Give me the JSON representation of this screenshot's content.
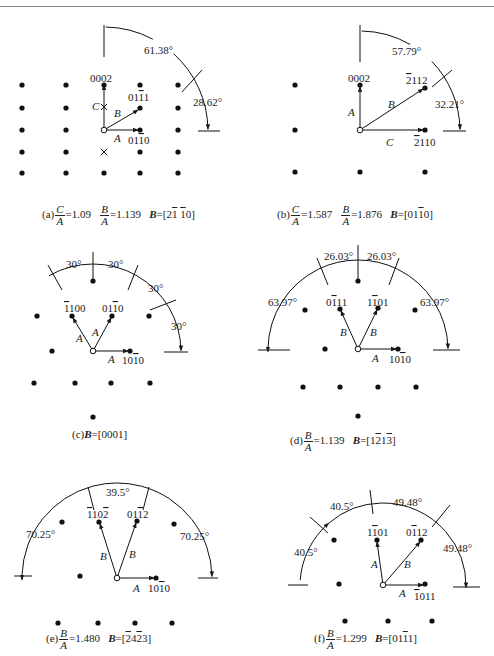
{
  "figure": {
    "panels": [
      {
        "id": "a",
        "caption": {
          "prefix": "(a)",
          "ratios": [
            {
              "num": "C",
              "den": "A",
              "value": "=1.09"
            },
            {
              "num": "B",
              "den": "A",
              "value": "=1.139"
            }
          ],
          "axis_label": "B",
          "axis_value": "=[2̅1̅ 1̅0]",
          "axis_parts": [
            [
              "2",
              false
            ],
            [
              "1",
              true
            ],
            [
              " ",
              false
            ],
            [
              "1",
              true
            ],
            [
              "0",
              false
            ]
          ]
        },
        "origin": [
          104,
          130
        ],
        "dots": [
          [
            22,
            85
          ],
          [
            66,
            85
          ],
          [
            104,
            85
          ],
          [
            140,
            85
          ],
          [
            178,
            85
          ],
          [
            22,
            108
          ],
          [
            66,
            108
          ],
          [
            140,
            108
          ],
          [
            178,
            108
          ],
          [
            22,
            130
          ],
          [
            66,
            130
          ],
          [
            140,
            130
          ],
          [
            178,
            130
          ],
          [
            22,
            152
          ],
          [
            66,
            152
          ],
          [
            140,
            152
          ],
          [
            178,
            152
          ],
          [
            22,
            173
          ],
          [
            66,
            173
          ],
          [
            104,
            173
          ],
          [
            140,
            173
          ],
          [
            178,
            173
          ]
        ],
        "crosses": [
          [
            104,
            107
          ],
          [
            104,
            152
          ]
        ],
        "vectors": [
          {
            "to": [
              104,
              85
            ],
            "label": "C",
            "lx": 92,
            "ly": 110
          },
          {
            "to": [
              138,
              110
            ],
            "label": "B",
            "lx": 114,
            "ly": 117
          },
          {
            "to": [
              138,
              130
            ],
            "label": "A",
            "lx": 114,
            "ly": 142
          }
        ],
        "spot_labels": [
          {
            "text": [
              [
                "0002",
                false
              ]
            ],
            "x": 90,
            "y": 82
          },
          {
            "text": [
              [
                "01",
                false
              ],
              [
                "1",
                true
              ],
              [
                "1",
                false
              ]
            ],
            "x": 128,
            "y": 101
          },
          {
            "text": [
              [
                "01",
                false
              ],
              [
                "1",
                true
              ],
              [
                "0",
                false
              ]
            ],
            "x": 128,
            "y": 144
          }
        ],
        "angles": [
          "61.38°",
          "28.62°"
        ]
      },
      {
        "id": "b",
        "caption": {
          "prefix": "(b)",
          "ratios": [
            {
              "num": "C",
              "den": "A",
              "value": "=1.587"
            },
            {
              "num": "B",
              "den": "A",
              "value": "=1.876"
            }
          ],
          "axis_label": "B",
          "axis_parts": [
            [
              "01",
              false
            ],
            [
              "1",
              true
            ],
            [
              "0",
              false
            ]
          ]
        },
        "spot_labels": [
          {
            "text": [
              [
                "0002",
                false
              ]
            ],
            "x": 0,
            "y": 0
          },
          {
            "text": [
              [
                "2",
                true
              ],
              [
                "112",
                false
              ]
            ],
            "x": 0,
            "y": 0
          },
          {
            "text": [
              [
                "2",
                true
              ],
              [
                "110",
                false
              ]
            ],
            "x": 0,
            "y": 0
          }
        ],
        "vectors": [
          {
            "label": "A"
          },
          {
            "label": "B"
          },
          {
            "label": "C"
          }
        ],
        "angles": [
          "57.79°",
          "32.21°"
        ]
      },
      {
        "id": "c",
        "caption": {
          "prefix": "(c)",
          "axis_label": "B",
          "axis_parts": [
            [
              "0001",
              false
            ]
          ]
        },
        "spot_labels": [
          {
            "text": [
              [
                "1",
                true
              ],
              [
                "100",
                false
              ]
            ]
          },
          {
            "text": [
              [
                "01",
                false
              ],
              [
                "1",
                true
              ],
              [
                "0",
                false
              ]
            ]
          },
          {
            "text": [
              [
                "10",
                false
              ],
              [
                "1",
                true
              ],
              [
                "0",
                false
              ]
            ]
          }
        ],
        "vectors": [
          {
            "label": "A"
          },
          {
            "label": "A"
          },
          {
            "label": "A"
          }
        ],
        "angles": [
          "30°",
          "30°",
          "30°",
          "30°"
        ]
      },
      {
        "id": "d",
        "caption": {
          "prefix": "(d)",
          "ratios": [
            {
              "num": "B",
              "den": "A",
              "value": "=1.139"
            }
          ],
          "axis_label": "B",
          "axis_parts": [
            [
              "1",
              false
            ],
            [
              "2",
              true
            ],
            [
              "1",
              false
            ],
            [
              "3",
              true
            ]
          ]
        },
        "spot_labels": [
          {
            "text": [
              [
                "0",
                false
              ],
              [
                "1",
                true
              ],
              [
                "11",
                false
              ]
            ]
          },
          {
            "text": [
              [
                "1",
                false
              ],
              [
                "1",
                true
              ],
              [
                "01",
                false
              ]
            ]
          },
          {
            "text": [
              [
                "10",
                false
              ],
              [
                "1",
                true
              ],
              [
                "0",
                false
              ]
            ]
          }
        ],
        "vectors": [
          {
            "label": "B"
          },
          {
            "label": "B"
          },
          {
            "label": "A"
          }
        ],
        "angles": [
          "26.03°",
          "26.03°",
          "63.97°",
          "63.97°"
        ]
      },
      {
        "id": "e",
        "caption": {
          "prefix": "(e)",
          "ratios": [
            {
              "num": "B",
              "den": "A",
              "value": "=1.480"
            }
          ],
          "axis_label": "B",
          "axis_parts": [
            [
              "2",
              true
            ],
            [
              "4",
              false
            ],
            [
              "2",
              true
            ],
            [
              "3",
              false
            ]
          ]
        },
        "spot_labels": [
          {
            "text": [
              [
                "1",
                true
              ],
              [
                "10",
                false
              ],
              [
                "2",
                true
              ]
            ]
          },
          {
            "text": [
              [
                "01",
                false
              ],
              [
                "1",
                true
              ],
              [
                "2",
                false
              ]
            ]
          },
          {
            "text": [
              [
                "10",
                false
              ],
              [
                "1",
                true
              ],
              [
                "0",
                false
              ]
            ]
          }
        ],
        "vectors": [
          {
            "label": "B"
          },
          {
            "label": "B"
          },
          {
            "label": "A"
          }
        ],
        "angles": [
          "39.5°",
          "70.25°",
          "70.25°"
        ]
      },
      {
        "id": "f",
        "caption": {
          "prefix": "(f)",
          "ratios": [
            {
              "num": "B",
              "den": "A",
              "value": "=1.299"
            }
          ],
          "axis_label": "B",
          "axis_parts": [
            [
              "01",
              false
            ],
            [
              "1",
              true
            ],
            [
              "1",
              false
            ]
          ]
        },
        "spot_labels": [
          {
            "text": [
              [
                "1",
                false
              ],
              [
                "1",
                true
              ],
              [
                "01",
                false
              ]
            ]
          },
          {
            "text": [
              [
                "0",
                false
              ],
              [
                "1",
                true
              ],
              [
                "12",
                false
              ]
            ]
          },
          {
            "text": [
              [
                "1",
                true
              ],
              [
                "011",
                false
              ]
            ]
          }
        ],
        "vectors": [
          {
            "label": "A"
          },
          {
            "label": "B"
          },
          {
            "label": "A"
          }
        ],
        "angles": [
          "40.5°",
          "49.48°",
          "40.5°",
          "49.48°"
        ]
      }
    ]
  }
}
